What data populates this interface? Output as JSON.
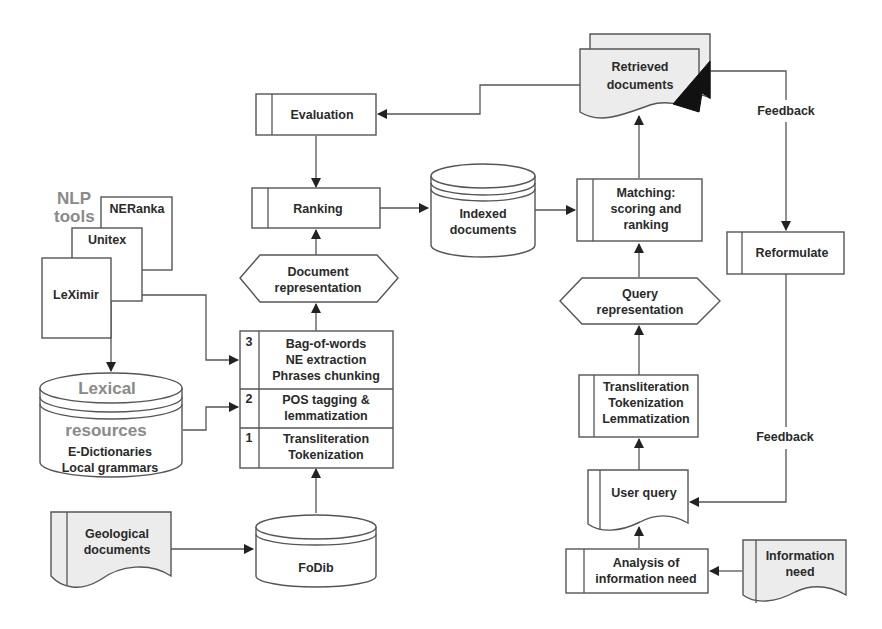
{
  "diagram": {
    "nlp_tools": {
      "group_label_line1": "NLP",
      "group_label_line2": "tools",
      "tools": [
        "NERanka",
        "Unitex",
        "LeXimir"
      ]
    },
    "lexical_resources": {
      "title_line1": "Lexical",
      "title_line2": "resources",
      "items": [
        "E-Dictionaries",
        "Local grammars"
      ]
    },
    "geological_documents": {
      "line1": "Geological",
      "line2": "documents"
    },
    "fodib": {
      "label": "FoDib"
    },
    "processing_layers": [
      {
        "number": "3",
        "lines": [
          "Bag-of-words",
          "NE extraction",
          "Phrases chunking"
        ]
      },
      {
        "number": "2",
        "lines": [
          "POS tagging &",
          "lemmatization"
        ]
      },
      {
        "number": "1",
        "lines": [
          "Transliteration",
          "Tokenization"
        ]
      }
    ],
    "document_representation": {
      "line1": "Document",
      "line2": "representation"
    },
    "ranking": {
      "label": "Ranking"
    },
    "evaluation": {
      "label": "Evaluation"
    },
    "indexed_documents": {
      "line1": "Indexed",
      "line2": "documents"
    },
    "matching": {
      "line1": "Matching:",
      "line2": "scoring and",
      "line3": "ranking"
    },
    "retrieved_documents": {
      "line1": "Retrieved",
      "line2": "documents"
    },
    "reformulate": {
      "label": "Reformulate"
    },
    "query_representation": {
      "line1": "Query",
      "line2": "representation"
    },
    "query_processing": {
      "lines": [
        "Transliteration",
        "Tokenization",
        "Lemmatization"
      ]
    },
    "user_query": {
      "label": "User query"
    },
    "analysis": {
      "line1": "Analysis of",
      "line2": "information need"
    },
    "information_need": {
      "line1": "Information",
      "line2": "need"
    },
    "feedback_labels": [
      "Feedback",
      "Feedback"
    ]
  }
}
